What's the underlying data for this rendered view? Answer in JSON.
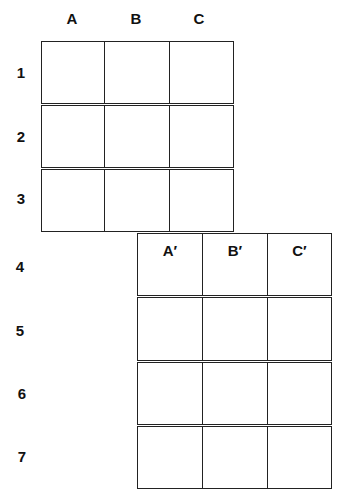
{
  "top_grid": {
    "column_labels": [
      "A",
      "B",
      "C"
    ],
    "row_labels": [
      "1",
      "2",
      "3"
    ]
  },
  "bottom_grid": {
    "column_labels": [
      "A′",
      "B′",
      "C′"
    ],
    "row_labels": [
      "4",
      "5",
      "6",
      "7"
    ]
  }
}
